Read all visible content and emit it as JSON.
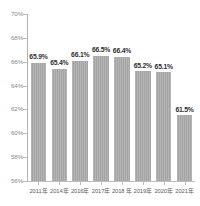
{
  "chart_data": {
    "type": "bar",
    "title": "",
    "subtitle": "",
    "xlabel": "",
    "ylabel": "",
    "categories": [
      "2011年",
      "2014年",
      "2016年",
      "2017年",
      "2018 年",
      "2019年",
      "2020年",
      "2021年"
    ],
    "values": [
      65.9,
      65.4,
      66.1,
      66.5,
      66.4,
      65.2,
      65.1,
      61.5
    ],
    "value_labels": [
      "65.9%",
      "65.4%",
      "66.1%",
      "66.5%",
      "66.4%",
      "65.2%",
      "65.1%",
      "61.5%"
    ],
    "ylim": [
      56,
      70
    ],
    "ytick_values": [
      56,
      58,
      60,
      62,
      64,
      66,
      68,
      70
    ],
    "ytick_labels": [
      "56%",
      "58%",
      "60%",
      "62%",
      "64%",
      "66%",
      "68%",
      "70%"
    ],
    "grid": false,
    "legend": null,
    "legend_position": "none",
    "series": [
      {
        "name": "",
        "values": [
          65.9,
          65.4,
          66.1,
          66.5,
          66.4,
          65.2,
          65.1,
          61.5
        ],
        "color": "#a5a5a5"
      }
    ]
  },
  "style": {
    "bar_color": "#a5a5a5",
    "axis_color": "#b7b7b7",
    "tick_label_color": "#8a8a8a",
    "value_label_color": "#2e2e2e",
    "x_label_color": "#5c5c5c",
    "background": "#ffffff"
  }
}
